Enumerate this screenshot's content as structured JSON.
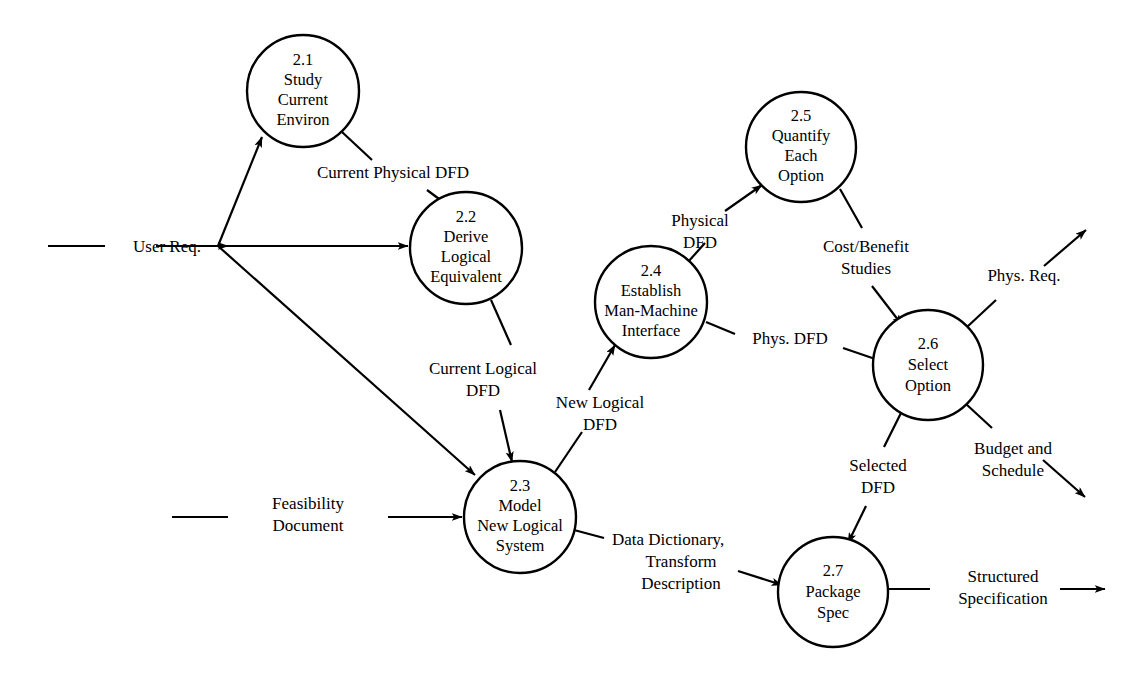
{
  "diagram": {
    "type": "data-flow-diagram",
    "stroke_color": "#000000",
    "background_color": "#ffffff",
    "processes": [
      {
        "id": "2.1",
        "lines": [
          "2.1",
          "Study",
          "Current",
          "Environ"
        ],
        "cx": 303,
        "cy": 91,
        "r": 56
      },
      {
        "id": "2.2",
        "lines": [
          "2.2",
          "Derive",
          "Logical",
          "Equivalent"
        ],
        "cx": 466,
        "cy": 248,
        "r": 56
      },
      {
        "id": "2.3",
        "lines": [
          "2.3",
          "Model",
          "New Logical",
          "System"
        ],
        "cx": 520,
        "cy": 517,
        "r": 56
      },
      {
        "id": "2.4",
        "lines": [
          "2.4",
          "Establish",
          "Man-Machine",
          "Interface"
        ],
        "cx": 651,
        "cy": 302,
        "r": 56
      },
      {
        "id": "2.5",
        "lines": [
          "2.5",
          "Quantify",
          "Each",
          "Option"
        ],
        "cx": 801,
        "cy": 147,
        "r": 55
      },
      {
        "id": "2.6",
        "lines": [
          "2.6",
          "Select",
          "Option"
        ],
        "cx": 928,
        "cy": 365,
        "r": 55
      },
      {
        "id": "2.7",
        "lines": [
          "2.7",
          "Package",
          "Spec"
        ],
        "cx": 833,
        "cy": 592,
        "r": 55
      }
    ],
    "external_inputs": [
      {
        "name": "user-req",
        "label": "User Req.",
        "x": 120,
        "y": 250
      },
      {
        "name": "feasibility-document",
        "label_lines": [
          "Feasibility",
          "Document"
        ],
        "x": 250,
        "y": 512
      }
    ],
    "flows": [
      {
        "name": "current-physical-dfd",
        "label_lines": [
          "Current Physical DFD"
        ],
        "from": "2.1",
        "to": "2.2"
      },
      {
        "name": "current-logical-dfd",
        "label_lines": [
          "Current Logical",
          "DFD"
        ],
        "from": "2.2",
        "to": "2.3"
      },
      {
        "name": "new-logical-dfd",
        "label_lines": [
          "New Logical",
          "DFD"
        ],
        "from": "2.3",
        "to": "2.4"
      },
      {
        "name": "physical-dfd",
        "label_lines": [
          "Physical",
          "DFD"
        ],
        "from": "2.4",
        "to": "2.5"
      },
      {
        "name": "phys-dfd",
        "label_lines": [
          "Phys. DFD"
        ],
        "from": "2.4",
        "to": "2.6"
      },
      {
        "name": "cost-benefit-studies",
        "label_lines": [
          "Cost/Benefit",
          "Studies"
        ],
        "from": "2.5",
        "to": "2.6"
      },
      {
        "name": "selected-dfd",
        "label_lines": [
          "Selected",
          "DFD"
        ],
        "from": "2.6",
        "to": "2.7"
      },
      {
        "name": "data-dictionary-transform-description",
        "label_lines": [
          "Data Dictionary,",
          "Transform",
          "Description"
        ],
        "from": "2.3",
        "to": "2.7"
      },
      {
        "name": "phys-req",
        "label_lines": [
          "Phys. Req."
        ],
        "from": "2.6",
        "to": "external"
      },
      {
        "name": "budget-and-schedule",
        "label_lines": [
          "Budget and",
          "Schedule"
        ],
        "from": "2.6",
        "to": "external"
      },
      {
        "name": "structured-specification",
        "label_lines": [
          "Structured",
          "Specification"
        ],
        "from": "2.7",
        "to": "external"
      }
    ],
    "labels": {
      "user_req": "User Req.",
      "feasibility_1": "Feasibility",
      "feasibility_2": "Document",
      "current_physical_dfd": "Current Physical DFD",
      "current_logical_1": "Current Logical",
      "current_logical_2": "DFD",
      "new_logical_1": "New Logical",
      "new_logical_2": "DFD",
      "physical_1": "Physical",
      "physical_2": "DFD",
      "phys_dfd": "Phys. DFD",
      "cost_benefit_1": "Cost/Benefit",
      "cost_benefit_2": "Studies",
      "selected_1": "Selected",
      "selected_2": "DFD",
      "data_dict_1": "Data Dictionary,",
      "data_dict_2": "Transform",
      "data_dict_3": "Description",
      "phys_req": "Phys. Req.",
      "budget_1": "Budget and",
      "budget_2": "Schedule",
      "structured_1": "Structured",
      "structured_2": "Specification"
    },
    "process_text": {
      "p21": {
        "l1": "2.1",
        "l2": "Study",
        "l3": "Current",
        "l4": "Environ"
      },
      "p22": {
        "l1": "2.2",
        "l2": "Derive",
        "l3": "Logical",
        "l4": "Equivalent"
      },
      "p23": {
        "l1": "2.3",
        "l2": "Model",
        "l3": "New Logical",
        "l4": "System"
      },
      "p24": {
        "l1": "2.4",
        "l2": "Establish",
        "l3": "Man-Machine",
        "l4": "Interface"
      },
      "p25": {
        "l1": "2.5",
        "l2": "Quantify",
        "l3": "Each",
        "l4": "Option"
      },
      "p26": {
        "l1": "2.6",
        "l2": "Select",
        "l3": "Option"
      },
      "p27": {
        "l1": "2.7",
        "l2": "Package",
        "l3": "Spec"
      }
    }
  }
}
